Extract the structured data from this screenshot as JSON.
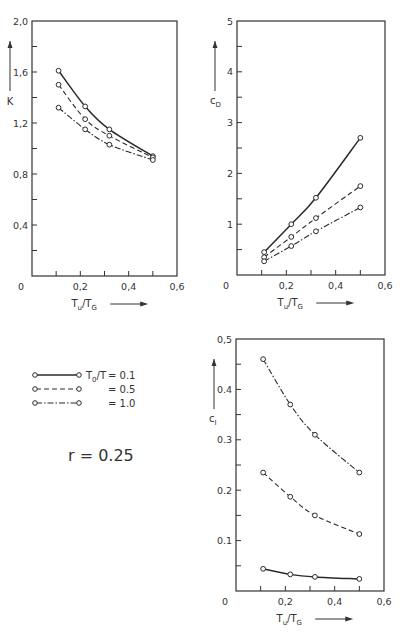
{
  "chart_data": [
    {
      "type": "line",
      "id": "K",
      "ylabel": "K",
      "xlabel": "T_u/T_G",
      "xlim": [
        0,
        0.6
      ],
      "ylim": [
        0,
        2.0
      ],
      "xticks": [
        0,
        0.1,
        0.2,
        0.3,
        0.4,
        0.5,
        0.6
      ],
      "xtick_labels": [
        "0",
        "0,2",
        "0,4",
        "0,6"
      ],
      "yticks": [
        0.2,
        0.4,
        0.6,
        0.8,
        1.0,
        1.2,
        1.4,
        1.6,
        1.8,
        2.0
      ],
      "ytick_labels": [
        "0,4",
        "0,8",
        "1,2",
        "1,6",
        "2,0"
      ],
      "x": [
        0.11,
        0.22,
        0.32,
        0.5
      ],
      "series": [
        {
          "name": "T0/T = 0.1",
          "style": "solid",
          "values": [
            1.61,
            1.33,
            1.15,
            0.94
          ]
        },
        {
          "name": "T0/T = 0.5",
          "style": "dashed",
          "values": [
            1.5,
            1.23,
            1.1,
            0.93
          ]
        },
        {
          "name": "T0/T = 1.0",
          "style": "dashdot",
          "values": [
            1.32,
            1.15,
            1.03,
            0.91
          ]
        }
      ],
      "grid": false
    },
    {
      "type": "line",
      "id": "cD",
      "ylabel": "c_D",
      "xlabel": "T_u/T_G",
      "xlim": [
        0,
        0.6
      ],
      "ylim": [
        0,
        5
      ],
      "xticks": [
        0,
        0.1,
        0.2,
        0.3,
        0.4,
        0.5,
        0.6
      ],
      "xtick_labels": [
        "0",
        "0,2",
        "0,4",
        "0,6"
      ],
      "yticks": [
        0.5,
        1,
        1.5,
        2,
        2.5,
        3,
        3.5,
        4,
        4.5,
        5
      ],
      "ytick_labels": [
        "1",
        "2",
        "3",
        "4",
        "5"
      ],
      "x": [
        0.11,
        0.22,
        0.32,
        0.5
      ],
      "series": [
        {
          "name": "T0/T = 0.1",
          "style": "solid",
          "values": [
            0.45,
            1.0,
            1.52,
            2.7
          ]
        },
        {
          "name": "T0/T = 0.5",
          "style": "dashed",
          "values": [
            0.35,
            0.75,
            1.12,
            1.75
          ]
        },
        {
          "name": "T0/T = 1.0",
          "style": "dashdot",
          "values": [
            0.27,
            0.57,
            0.86,
            1.33
          ]
        }
      ],
      "grid": false
    },
    {
      "type": "line",
      "id": "cI",
      "ylabel": "c_I",
      "xlabel": "T_u/T_G",
      "xlim": [
        0,
        0.6
      ],
      "ylim": [
        0,
        0.5
      ],
      "xticks": [
        0,
        0.1,
        0.2,
        0.3,
        0.4,
        0.5,
        0.6
      ],
      "xtick_labels": [
        "0",
        "0,2",
        "0,4",
        "0,6"
      ],
      "yticks": [
        0.05,
        0.1,
        0.15,
        0.2,
        0.25,
        0.3,
        0.35,
        0.4,
        0.45,
        0.5
      ],
      "ytick_labels": [
        "0.1",
        "0.2",
        "0.3",
        "0.4",
        "0,5"
      ],
      "x": [
        0.11,
        0.22,
        0.32,
        0.5
      ],
      "series": [
        {
          "name": "T0/T = 0.1",
          "style": "solid",
          "values": [
            0.044,
            0.033,
            0.028,
            0.024
          ]
        },
        {
          "name": "T0/T = 0.5",
          "style": "dashed",
          "values": [
            0.235,
            0.187,
            0.15,
            0.113
          ]
        },
        {
          "name": "T0/T = 1.0",
          "style": "dashdot",
          "values": [
            0.46,
            0.37,
            0.31,
            0.235
          ]
        }
      ],
      "grid": false
    }
  ],
  "legend": {
    "param_label": "T0/T",
    "items": [
      {
        "style": "solid",
        "value": "= 0.1"
      },
      {
        "style": "dashed",
        "value": "= 0.5"
      },
      {
        "style": "dashdot",
        "value": "= 1.0"
      }
    ]
  },
  "annotation": "r = 0.25",
  "colors": {
    "line": "#2a2a2a",
    "frame": "#333333"
  }
}
